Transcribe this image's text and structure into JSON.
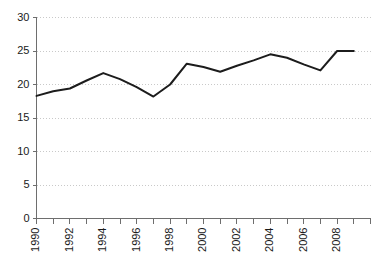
{
  "chart_data": {
    "type": "line",
    "title": "",
    "subtitle": "",
    "xlabel": "",
    "ylabel": "",
    "x": [
      1990,
      1991,
      1992,
      1993,
      1994,
      1995,
      1996,
      1997,
      1998,
      1999,
      2000,
      2001,
      2002,
      2003,
      2004,
      2005,
      2006,
      2007,
      2008,
      2009
    ],
    "values": [
      18.3,
      19.0,
      19.4,
      20.6,
      21.7,
      20.8,
      19.6,
      18.2,
      20.0,
      23.1,
      22.6,
      21.9,
      22.8,
      23.6,
      24.5,
      24.0,
      23.0,
      22.1,
      25.0,
      25.0
    ],
    "series": [
      {
        "name": "series-1",
        "color": "#1c1c1c",
        "values": [
          18.3,
          19.0,
          19.4,
          20.6,
          21.7,
          20.8,
          19.6,
          18.2,
          20.0,
          23.1,
          22.6,
          21.9,
          22.8,
          23.6,
          24.5,
          24.0,
          23.0,
          22.1,
          25.0,
          25.0
        ]
      }
    ],
    "ylim": [
      0,
      30
    ],
    "xlim": [
      1990,
      2010
    ],
    "yticks": [
      0,
      5,
      10,
      15,
      20,
      25,
      30
    ],
    "ytick_labels": [
      "0",
      "5",
      "10",
      "15",
      "20",
      "25",
      "30"
    ],
    "xticks": [
      1990,
      1991,
      1992,
      1993,
      1994,
      1995,
      1996,
      1997,
      1998,
      1999,
      2000,
      2001,
      2002,
      2003,
      2004,
      2005,
      2006,
      2007,
      2008,
      2009,
      2010
    ],
    "xtick_labels": [
      "1990",
      "",
      "1992",
      "",
      "1994",
      "",
      "1996",
      "",
      "1998",
      "",
      "2000",
      "",
      "2002",
      "",
      "2004",
      "",
      "2006",
      "",
      "2008",
      "",
      ""
    ],
    "grid": true,
    "grid_axis": "y",
    "grid_color": "#c9c9c9",
    "axis_color": "#6e6e6e",
    "legend": false,
    "legend_position": "none",
    "background": "#ffffff"
  }
}
